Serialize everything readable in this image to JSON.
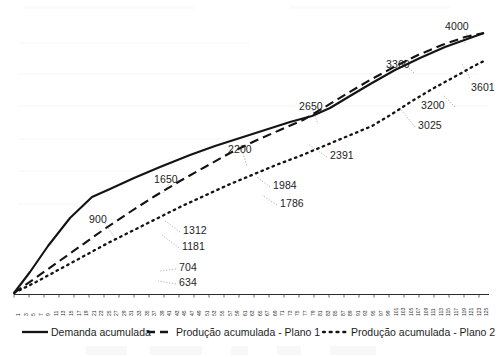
{
  "chart_data": {
    "type": "line",
    "title": "",
    "subtitle": "",
    "xlabel": "",
    "ylabel": "",
    "grid": false,
    "legend_position": "bottom",
    "xlim": [
      1,
      125
    ],
    "ylim": [
      0,
      4000
    ],
    "x_tick_labels": [
      "1",
      "3",
      "5",
      "7",
      "9",
      "11",
      "13",
      "15",
      "17",
      "19",
      "21",
      "23",
      "25",
      "27",
      "29",
      "31",
      "33",
      "35",
      "37",
      "39",
      "41",
      "43",
      "45",
      "47",
      "49",
      "51",
      "53",
      "55",
      "57",
      "59",
      "61",
      "63",
      "65",
      "67",
      "69",
      "71",
      "73",
      "75",
      "77",
      "79",
      "81",
      "83",
      "85",
      "87",
      "89",
      "91",
      "93",
      "95",
      "97",
      "99",
      "101",
      "103",
      "105",
      "107",
      "109",
      "111",
      "113",
      "115",
      "117",
      "119",
      "121",
      "123",
      "125"
    ],
    "series": [
      {
        "name": "Demanda acumulada",
        "style": "solid",
        "color": "#1a1a1a",
        "x": [
          1,
          45,
          85,
          125
        ],
        "y": [
          0,
          1650,
          2650,
          4000
        ],
        "point_labels": [
          {
            "value": "900",
            "x": 26,
            "y": 900
          },
          {
            "value": "1650",
            "x": 45,
            "y": 1650
          },
          {
            "value": "2200",
            "x": 63,
            "y": 2200
          },
          {
            "value": "2650",
            "x": 85,
            "y": 2650
          },
          {
            "value": "4000",
            "x": 125,
            "y": 4000
          }
        ]
      },
      {
        "name": "Produção acumulada - Plano 1",
        "style": "dashed",
        "color": "#1a1a1a",
        "x": [
          1,
          45,
          85,
          107,
          125
        ],
        "y": [
          0,
          1312,
          2650,
          3360,
          4000
        ],
        "point_labels": [
          {
            "value": "704",
            "x": 24,
            "y": 704
          },
          {
            "value": "1312",
            "x": 45,
            "y": 1312
          },
          {
            "value": "1984",
            "x": 67,
            "y": 1984
          },
          {
            "value": "3360",
            "x": 107,
            "y": 3360
          }
        ]
      },
      {
        "name": "Produção acumulada - Plano 2",
        "style": "dotted",
        "color": "#1a1a1a",
        "x": [
          1,
          45,
          99,
          125
        ],
        "y": [
          0,
          1181,
          3025,
          3601
        ],
        "point_labels": [
          {
            "value": "634",
            "x": 24,
            "y": 634
          },
          {
            "value": "1181",
            "x": 45,
            "y": 1181
          },
          {
            "value": "1786",
            "x": 67,
            "y": 1786
          },
          {
            "value": "2391",
            "x": 81,
            "y": 2391
          },
          {
            "value": "3025",
            "x": 99,
            "y": 3025
          },
          {
            "value": "3200",
            "x": 110,
            "y": 3200
          },
          {
            "value": "3601",
            "x": 125,
            "y": 3601
          }
        ]
      }
    ]
  },
  "legend": {
    "items": [
      {
        "label": "Demanda acumulada",
        "style": "solid"
      },
      {
        "label": "Produção acumulada - Plano 1",
        "style": "dashed"
      },
      {
        "label": "Produção acumulada - Plano 2",
        "style": "dotted"
      }
    ]
  },
  "labels": {
    "l4000": "4000",
    "l3360": "3360",
    "l3601": "3601",
    "l3200": "3200",
    "l3025": "3025",
    "l2650": "2650",
    "l2391": "2391",
    "l2200": "2200",
    "l1984": "1984",
    "l1786": "1786",
    "l1650": "1650",
    "l1312": "1312",
    "l1181": "1181",
    "l900": "900",
    "l704": "704",
    "l634": "634"
  }
}
